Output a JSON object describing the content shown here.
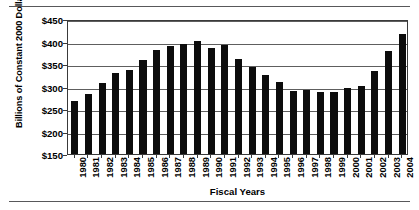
{
  "figure": {
    "has_top_rule": true,
    "has_bottom_rule": true,
    "frame_color": "#3a3a3a",
    "bar_color": "#0c0c0c",
    "grid_color": "#5e5e5e",
    "rule_color": "#58585a"
  },
  "chart_data": {
    "type": "bar",
    "title": "",
    "xlabel": "Fiscal Years",
    "ylabel": "Billions of Constant 2000 Dollars",
    "categories": [
      "1980",
      "1981",
      "1982",
      "1983",
      "1984",
      "1985",
      "1986",
      "1987",
      "1988",
      "1989",
      "1990",
      "1991",
      "1992",
      "1993",
      "1994",
      "1995",
      "1996",
      "1997",
      "1998",
      "1999",
      "2000",
      "2001",
      "2002",
      "2003",
      "2004"
    ],
    "values": [
      268,
      283,
      308,
      331,
      336,
      358,
      382,
      390,
      395,
      401,
      386,
      392,
      361,
      343,
      325,
      310,
      291,
      292,
      288,
      287,
      297,
      301,
      334,
      378,
      417
    ],
    "ylim": [
      150,
      450
    ],
    "yticks": [
      150,
      200,
      250,
      300,
      350,
      400,
      450
    ],
    "ytick_labels": [
      "$150",
      "$200",
      "$250",
      "$300",
      "$350",
      "$400",
      "$450"
    ],
    "grid": true,
    "grid_axis": "y",
    "legend": false,
    "legend_position": "none"
  }
}
